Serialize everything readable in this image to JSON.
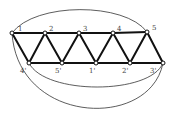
{
  "diagram": {
    "type": "graph",
    "nodes": [
      {
        "id": "1",
        "label": "1",
        "x": 12,
        "y": 33,
        "lx": 18,
        "ly": 31
      },
      {
        "id": "2",
        "label": "2",
        "x": 45,
        "y": 33,
        "lx": 49,
        "ly": 31
      },
      {
        "id": "3",
        "label": "3",
        "x": 79,
        "y": 33,
        "lx": 83,
        "ly": 31
      },
      {
        "id": "4",
        "label": "4",
        "x": 113,
        "y": 33,
        "lx": 117,
        "ly": 31
      },
      {
        "id": "5",
        "label": "5",
        "x": 147,
        "y": 32,
        "lx": 152,
        "ly": 30
      },
      {
        "id": "4p",
        "label": "4'",
        "x": 29,
        "y": 63,
        "lx": 20,
        "ly": 73
      },
      {
        "id": "5p",
        "label": "5'",
        "x": 62,
        "y": 63,
        "lx": 55,
        "ly": 73
      },
      {
        "id": "1p",
        "label": "1'",
        "x": 96,
        "y": 63,
        "lx": 89,
        "ly": 73
      },
      {
        "id": "2p",
        "label": "2'",
        "x": 130,
        "y": 63,
        "lx": 122,
        "ly": 73
      },
      {
        "id": "3p",
        "label": "3'",
        "x": 163,
        "y": 63,
        "lx": 150,
        "ly": 73
      }
    ],
    "edges": [
      [
        "1",
        "2"
      ],
      [
        "2",
        "3"
      ],
      [
        "3",
        "4"
      ],
      [
        "4",
        "5"
      ],
      [
        "4p",
        "5p"
      ],
      [
        "5p",
        "1p"
      ],
      [
        "1p",
        "2p"
      ],
      [
        "2p",
        "3p"
      ],
      [
        "1",
        "4p"
      ],
      [
        "4p",
        "2"
      ],
      [
        "2",
        "5p"
      ],
      [
        "5p",
        "3"
      ],
      [
        "3",
        "1p"
      ],
      [
        "1p",
        "4"
      ],
      [
        "4",
        "2p"
      ],
      [
        "2p",
        "5"
      ],
      [
        "5",
        "3p"
      ]
    ],
    "arcs": [
      {
        "from": "1",
        "to": "5",
        "path": "M12,33 C35,2 125,2 147,32"
      },
      {
        "from": "1",
        "to": "3p",
        "path": "M12,33 C18,125 150,130 163,63"
      },
      {
        "from": "4p",
        "to": "3p",
        "path": "M29,63 C45,95 150,95 163,63"
      }
    ]
  }
}
